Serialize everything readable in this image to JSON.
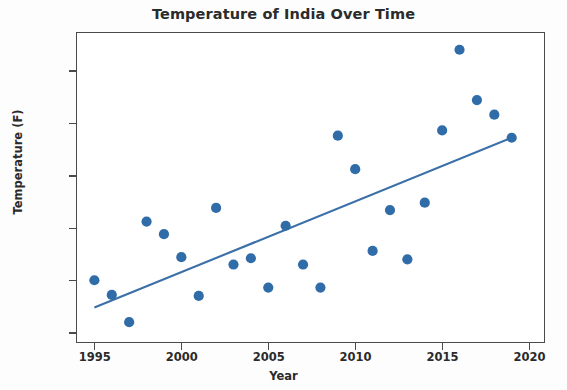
{
  "chart_data": {
    "type": "scatter",
    "title": "Temperature of India Over Time",
    "xlabel": "Year",
    "ylabel": "Temperature (F)",
    "xlim": [
      1994.0,
      2020.8
    ],
    "ylim": [
      79.42,
      82.36
    ],
    "grid": false,
    "legend": null,
    "marker_color": "#2f6ca8",
    "line_color": "#3a6fa8",
    "xticks": [
      1995,
      2000,
      2005,
      2010,
      2015,
      2020
    ],
    "xtick_labels": [
      "1995",
      "2000",
      "2005",
      "2010",
      "2015",
      "2020"
    ],
    "yticks": [
      79.5,
      80.0,
      80.5,
      81.0,
      81.5,
      82.0
    ],
    "ytick_labels": [
      "79.5",
      "80.0",
      "80.5",
      "81.0",
      "81.5",
      "82.0"
    ],
    "series": [
      {
        "name": "Temperature of India",
        "type": "scatter",
        "x": [
          1995,
          1996,
          1997,
          1998,
          1999,
          2000,
          2001,
          2002,
          2003,
          2004,
          2005,
          2006,
          2007,
          2008,
          2009,
          2010,
          2011,
          2012,
          2013,
          2014,
          2015,
          2016,
          2017,
          2018,
          2019
        ],
        "y": [
          80.0,
          79.86,
          79.6,
          80.56,
          80.44,
          80.22,
          79.85,
          80.69,
          80.15,
          80.21,
          79.93,
          80.52,
          80.15,
          79.93,
          81.38,
          81.06,
          80.28,
          80.67,
          80.2,
          80.74,
          81.43,
          82.2,
          81.72,
          81.58,
          81.36
        ]
      },
      {
        "name": "Trend line",
        "type": "line",
        "x": [
          1995,
          2019
        ],
        "y": [
          79.74,
          81.36
        ]
      }
    ]
  },
  "figure": {
    "title": "Temperature of India Over Time",
    "xlabel": "Year",
    "ylabel": "Temperature (F)"
  }
}
